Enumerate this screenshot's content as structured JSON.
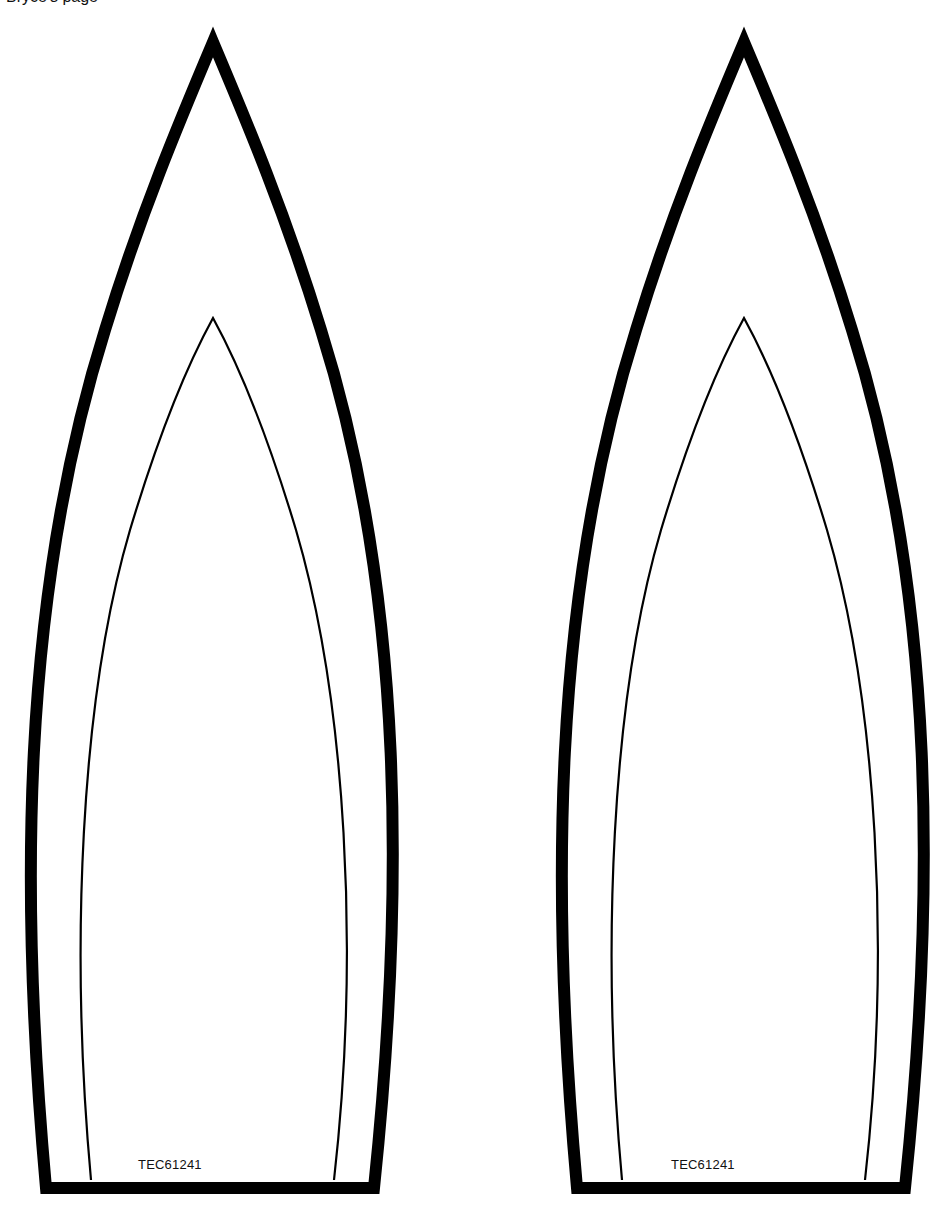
{
  "page": {
    "top_cropped_text": "Bryce's page"
  },
  "colors": {
    "stroke": "#000000",
    "background": "#ffffff"
  },
  "shapes": [
    {
      "id": "left",
      "label": "TEC61241",
      "offset_x": 0
    },
    {
      "id": "right",
      "label": "TEC61241",
      "offset_x": 531
    }
  ]
}
